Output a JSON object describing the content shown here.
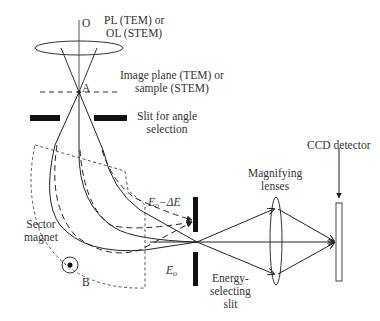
{
  "diagram": {
    "labels": {
      "origin": "O",
      "lens_line1": "PL (TEM) or",
      "lens_line2": "OL (STEM)",
      "image_plane_line1": "Image plane (TEM) or",
      "image_plane_line2": "sample (STEM)",
      "point_a": "A",
      "angle_slit_line1": "Slit for angle",
      "angle_slit_line2": "selection",
      "sector_line1": "Sector",
      "sector_line2": "magnet",
      "point_b": "B",
      "energy_loss": "E",
      "energy_loss_sub": "o",
      "energy_loss_suffix": "−ΔE",
      "energy_zero": "E",
      "energy_zero_sub": "o",
      "energy_slit_line1": "Energy-",
      "energy_slit_line2": "selecting",
      "energy_slit_line3": "slit",
      "magnifying_line1": "Magnifying",
      "magnifying_line2": "lenses",
      "ccd": "CCD detector"
    },
    "colors": {
      "ink": "#222222",
      "text": "#333333",
      "background": "#ffffff"
    }
  }
}
